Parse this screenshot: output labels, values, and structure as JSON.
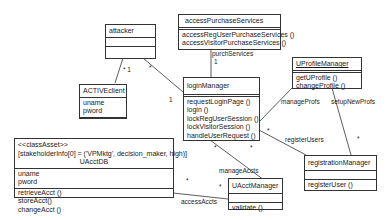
{
  "classes": {
    "attacker": {
      "name": "attacker",
      "attrs": [],
      "ops": []
    },
    "accessPurchaseServices": {
      "name": "accessPurchaseServices",
      "attrs": [],
      "ops": [
        "accessRegUserPurchaseServices ()",
        "accessVisitorPurchaseServices ()"
      ]
    },
    "activeClient": {
      "name": "ACTIVEclient",
      "attrs": [
        "uname",
        "pword"
      ],
      "ops": []
    },
    "loginManager": {
      "name": "loginManager",
      "attrs": [],
      "ops": [
        "requestLoginPage ()",
        "login ()",
        "lockRegUserSession ()",
        "lockVisitorSession ()",
        "handleUserRequest ()"
      ]
    },
    "uProfileManager": {
      "name": "UProfileManager",
      "attrs": [],
      "ops": [
        "getUProfile ()",
        "changeProfile ()"
      ]
    },
    "uAcctDB": {
      "stereotype": "<<classAsset>>",
      "tagged": "[stakeholderInfo[0] = ('VPMktg', decision_maker, high)]",
      "name": "UAcctDB",
      "attrs": [
        "uname",
        "pword"
      ],
      "ops": [
        "retrieveAcct ()",
        "storeAcct()",
        "changeAcct ()"
      ]
    },
    "registrationManager": {
      "name": "registrationManager",
      "attrs": [],
      "ops": [
        "registerUser ()"
      ]
    },
    "uAcctManager": {
      "name": "UAcctManager",
      "attrs": [],
      "ops": [
        "validate ()"
      ]
    }
  },
  "associations": {
    "purchServices": "purchServices",
    "purchServicesMult": "1",
    "attackerClientMult": "* 1",
    "attackerLoginMult": "*",
    "loginOne": "1",
    "manageProfs": "manageProfs",
    "setupNewProfs": "setupNewProfs",
    "registerUsers": "registerUsers",
    "manageAccts": "manageAccts",
    "accessAccts": "accessAccts",
    "star": "*"
  }
}
